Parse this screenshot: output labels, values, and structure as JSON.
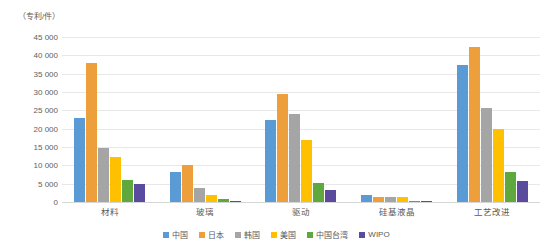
{
  "chart_data": {
    "type": "bar",
    "title": "",
    "subtitle": "",
    "xlabel": "",
    "ylabel": "（专利/件）",
    "ylim": [
      0,
      45000
    ],
    "ytick_step": 5000,
    "ytick_labels": [
      "45 000",
      "40 000",
      "35 000",
      "30 000",
      "25 000",
      "20 000",
      "15 000",
      "10 000",
      "5 000",
      "0"
    ],
    "ytick_values": [
      45000,
      40000,
      35000,
      30000,
      25000,
      20000,
      15000,
      10000,
      5000,
      0
    ],
    "grid": true,
    "legend_position": "bottom",
    "categories": [
      "材料",
      "玻璃",
      "驱动",
      "硅基液晶",
      "工艺改进"
    ],
    "series": [
      {
        "name": "中国",
        "color": "#5B9BD5",
        "values": [
          22800,
          8300,
          22400,
          1900,
          37400
        ]
      },
      {
        "name": "日本",
        "color": "#ED9F3C",
        "values": [
          37900,
          10100,
          29400,
          1500,
          42200
        ]
      },
      {
        "name": "韩国",
        "color": "#A5A5A5",
        "values": [
          14600,
          3800,
          24100,
          1300,
          25700
        ]
      },
      {
        "name": "美国",
        "color": "#FFC000",
        "values": [
          12300,
          1900,
          17000,
          1400,
          19800
        ]
      },
      {
        "name": "中国台湾",
        "color": "#5FA83E",
        "values": [
          6100,
          800,
          5100,
          300,
          8300
        ]
      },
      {
        "name": "WIPO",
        "color": "#5B4B9E",
        "values": [
          4900,
          400,
          3300,
          200,
          5600
        ]
      }
    ]
  }
}
